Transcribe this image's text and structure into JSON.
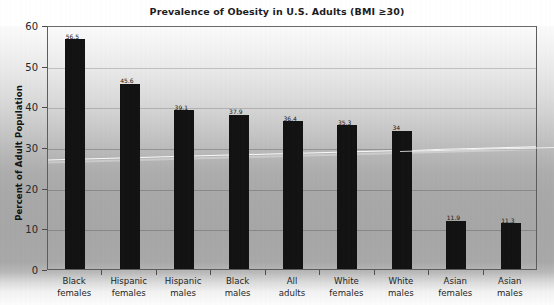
{
  "chart_data": {
    "type": "bar",
    "title": "Prevalence of Obesity in U.S. Adults (BMI ≥30)",
    "xlabel": "",
    "ylabel": "Percent of Adult Population",
    "ylim": [
      0,
      60
    ],
    "yticks": [
      0,
      10,
      20,
      30,
      40,
      50,
      60
    ],
    "ytick_labels": [
      "0",
      "10",
      "20",
      "30",
      "40",
      "50",
      "60"
    ],
    "grid": true,
    "legend": "none",
    "bar_color": "#121212",
    "categories": [
      "Black females",
      "Hispanic females",
      "Hispanic males",
      "Black males",
      "All adults",
      "White females",
      "White males",
      "Asian females",
      "Asian males"
    ],
    "category_lines": [
      [
        "Black",
        "females"
      ],
      [
        "Hispanic",
        "females"
      ],
      [
        "Hispanic",
        "males"
      ],
      [
        "Black",
        "males"
      ],
      [
        "All",
        "adults"
      ],
      [
        "White",
        "females"
      ],
      [
        "White",
        "males"
      ],
      [
        "Asian",
        "females"
      ],
      [
        "Asian",
        "males"
      ]
    ],
    "values": [
      56.5,
      45.6,
      39.1,
      37.9,
      36.4,
      35.3,
      34,
      11.9,
      11.3
    ],
    "value_labels": [
      "56.5",
      "45.6",
      "39.1",
      "37.9",
      "36.4",
      "35.3",
      "34",
      "11.9",
      "11.3"
    ]
  }
}
